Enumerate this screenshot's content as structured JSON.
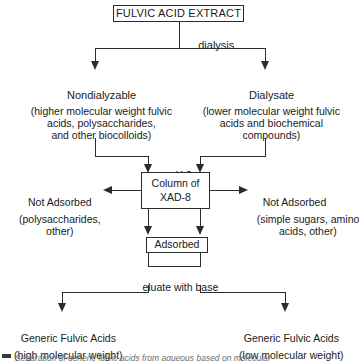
{
  "diagram": {
    "stroke_color": "#2b2b2b",
    "background_color": "#ffffff",
    "nodes": {
      "extract_box": "FULVIC ACID EXTRACT",
      "dialysis_label": "dialysis",
      "nondialyzable_title": "Nondialyzable",
      "nondialyzable_detail_line1": "(higher molecular weight fulvic",
      "nondialyzable_detail_line2": "acids, polysaccharides,",
      "nondialyzable_detail_line3": "and other biocolloids)",
      "dialysate_title": "Dialysate",
      "dialysate_detail_line1": "(lower molecular weight fulvic",
      "dialysate_detail_line2": "acids and biochemical",
      "dialysate_detail_line3": "compounds)",
      "ph_label": "pH 2",
      "column_box_line1": "Column of",
      "column_box_line2": "XAD-8",
      "not_adsorbed_left_title": "Not Adsorbed",
      "not_adsorbed_left_detail_line1": "(polysaccharides,",
      "not_adsorbed_left_detail_line2": "other)",
      "not_adsorbed_right_title": "Not Adsorbed",
      "not_adsorbed_right_detail_line1": "(simple sugars, amino",
      "not_adsorbed_right_detail_line2": "acids, other)",
      "adsorbed_box": "Adsorbed",
      "eluate_label": "eluate with base",
      "generic_high_title": "Generic Fulvic Acids",
      "generic_high_detail": "(high molecular weight)",
      "generic_low_title": "Generic Fulvic Acids",
      "generic_low_detail": "(low molecular weight)"
    },
    "caption": "Separation of generic fulvic acids from aqueous based on molecular"
  }
}
